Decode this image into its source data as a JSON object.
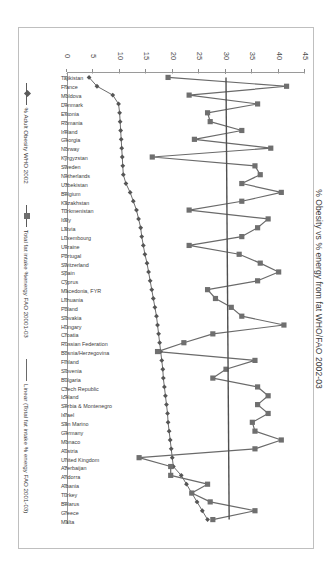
{
  "chart_data": {
    "type": "line",
    "title": "% Obesity  vs  % energy from fat WHO/FAO 2002-03",
    "xlabel": "",
    "ylabel": "",
    "ylim": [
      0,
      45
    ],
    "yticks": [
      0,
      5,
      10,
      15,
      20,
      25,
      30,
      35,
      40,
      45
    ],
    "grid": true,
    "legend_position": "bottom",
    "categories": [
      "Tajikistan",
      "France",
      "Moldova",
      "Denmark",
      "Estonia",
      "Romania",
      "Ireland",
      "Georgia",
      "Norway",
      "Kyrgyzstan",
      "Sweden",
      "Netherlands",
      "Uzbekistan",
      "Belgium",
      "Kazakhstan",
      "Turkmenistan",
      "Italy",
      "Latvia",
      "Luxembourg",
      "Ukraine",
      "Portugal",
      "Switzerland",
      "Spain",
      "Cyprus",
      "Macedonia, FYR",
      "Lithuania",
      "Poland",
      "Slovakia",
      "Hungary",
      "Croatia",
      "Russian Federation",
      "Bosnia/Herzegovina",
      "Finland",
      "Slovenia",
      "Bulgaria",
      "Czech Republic",
      "Iceland",
      "Serbia & Montenegro",
      "Israel",
      "San Marino",
      "Germany",
      "Monaco",
      "Austria",
      "United Kingdom",
      "Azerbaijan",
      "Andorra",
      "Albania",
      "Turkey",
      "Belarus",
      "Greece",
      "Malta"
    ],
    "series": [
      {
        "name": "% Adult Obesity WHO 2002",
        "marker": "diamond",
        "values": [
          4.0,
          5.5,
          8.5,
          9.6,
          9.8,
          9.9,
          10.0,
          10.1,
          10.2,
          10.3,
          10.4,
          10.5,
          11.0,
          11.8,
          12.4,
          13.0,
          13.4,
          13.8,
          14.0,
          14.3,
          14.6,
          15.0,
          15.3,
          15.6,
          15.9,
          16.2,
          16.5,
          16.8,
          17.0,
          17.2,
          17.4,
          17.6,
          17.8,
          18.0,
          18.1,
          18.3,
          18.5,
          18.7,
          18.9,
          19.0,
          19.2,
          19.4,
          19.6,
          19.8,
          20.0,
          21.5,
          22.5,
          23.5,
          24.5,
          25.5,
          26.5
        ]
      },
      {
        "name": "Total fat intake %energy FAO 20001-03",
        "marker": "square",
        "values": [
          19.0,
          41.5,
          23.0,
          36.0,
          26.5,
          27.0,
          33.0,
          24.0,
          38.5,
          16.0,
          35.5,
          36.5,
          33.0,
          40.5,
          33.0,
          23.0,
          38.0,
          36.0,
          33.0,
          23.0,
          32.5,
          36.5,
          40.0,
          36.0,
          26.5,
          28.0,
          31.0,
          33.0,
          41.0,
          27.5,
          22.0,
          17.0,
          35.5,
          30.0,
          27.5,
          36.0,
          38.0,
          36.0,
          38.0,
          35.0,
          35.5,
          40.5,
          35.5,
          13.5,
          19.5,
          19.5,
          26.5,
          23.5,
          27.0,
          35.5,
          27.5
        ]
      }
    ],
    "trendline": {
      "name": "Linear (Total fat intake % energy FAO 2001-03)",
      "start_value": 30.0,
      "end_value": 30.6
    }
  },
  "legend": {
    "entries": [
      {
        "label": "% Adult Obesity WHO 2002",
        "key": "diamond-line-key"
      },
      {
        "label": "Total fat intake %energy FAO 20001-03",
        "key": "square-line-key"
      },
      {
        "label": "Linear (Total fat intake % energy FAO 2001-03)",
        "key": "plain-line-key"
      }
    ]
  }
}
